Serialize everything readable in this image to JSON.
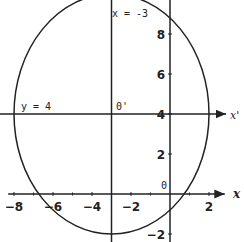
{
  "chart_data": {
    "type": "diagram",
    "title": "",
    "curve": {
      "kind": "ellipse",
      "center": [
        -3,
        4
      ],
      "semi_axis_x": 5,
      "semi_axis_y": 6,
      "equation": "(x+3)^2/25 + (y-4)^2/36 = 1"
    },
    "axes": {
      "x_label": "x",
      "xlim": [
        -8.3,
        2.4
      ],
      "ylim": [
        -2.3,
        10.2
      ],
      "x_ticks": [
        -8,
        -6,
        -4,
        -2,
        2
      ],
      "x_tick_labels": [
        "-8",
        "-6",
        "-4",
        "-2",
        "2"
      ],
      "y_ticks": [
        -2,
        2,
        4,
        6,
        8
      ],
      "y_tick_labels": [
        "-2",
        "2",
        "4",
        "6",
        "8"
      ],
      "origin_label": "0"
    },
    "translated_axes": {
      "x_prime_label": "x'",
      "origin_prime_label": "0'",
      "vertical_line_label": "x = -3",
      "horizontal_line_label": "y = 4",
      "vertical_line_x": -3,
      "horizontal_line_y": 4
    }
  }
}
